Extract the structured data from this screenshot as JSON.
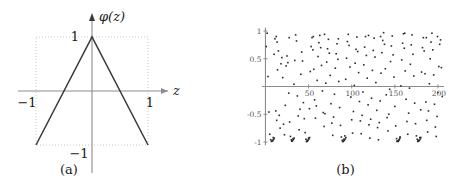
{
  "figure": {
    "panel_a": {
      "caption": "(a)",
      "yaxis_label": "φ(z)",
      "xaxis_label": "z",
      "ticks": {
        "y_top": "1",
        "y_bottom": "−1",
        "x_left": "−1",
        "x_right": "1"
      },
      "colors": {
        "curve": "#3a3a3a",
        "axis": "#8d8d8d",
        "box": "#c9c9c9"
      }
    },
    "panel_b": {
      "caption": "(b)",
      "colors": {
        "dot": "#2b2b2b",
        "axis": "#8d8d8d"
      }
    }
  },
  "chart_data": [
    {
      "type": "line",
      "title": "(a)",
      "xlabel": "z",
      "ylabel": "φ(z)",
      "xlim": [
        -1.32,
        1.42
      ],
      "ylim": [
        -1.45,
        1.32
      ],
      "xticks": [
        -1,
        1
      ],
      "xticklabels": [
        "−1",
        "1"
      ],
      "yticks": [
        -1,
        1
      ],
      "yticklabels": [
        "−1",
        "1"
      ],
      "grid": false,
      "bounding_box": {
        "x": [
          -1,
          1
        ],
        "y": [
          -1,
          1
        ],
        "style": "dotted"
      },
      "series": [
        {
          "name": "φ(z)",
          "x": [
            -1,
            0,
            1
          ],
          "values": [
            -1,
            1,
            -1
          ]
        }
      ]
    },
    {
      "type": "scatter",
      "title": "(b)",
      "xlabel": "",
      "ylabel": "",
      "xlim": [
        -4,
        207
      ],
      "ylim": [
        -1.08,
        1.08
      ],
      "xticks": [
        50,
        100,
        150,
        200
      ],
      "xticklabels": [
        "50",
        "100",
        "150",
        "200"
      ],
      "yticks": [
        -1,
        -0.5,
        0.5,
        1
      ],
      "yticklabels": [
        "-1",
        "-0.5",
        "0.5",
        "1"
      ],
      "grid": false,
      "n_points": 252,
      "points": [
        [
          1,
          0.72
        ],
        [
          2,
          0.96
        ],
        [
          3,
          0.18
        ],
        [
          4,
          -0.46
        ],
        [
          5,
          -0.86
        ],
        [
          6,
          -0.96
        ],
        [
          7,
          -0.99
        ],
        [
          8,
          -0.97
        ],
        [
          9,
          -0.92
        ],
        [
          10,
          0.58
        ],
        [
          11,
          0.86
        ],
        [
          12,
          -0.44
        ],
        [
          13,
          -0.61
        ],
        [
          14,
          0.3
        ],
        [
          15,
          0.64
        ],
        [
          16,
          -0.52
        ],
        [
          17,
          -0.75
        ],
        [
          18,
          0.41
        ],
        [
          19,
          0.52
        ],
        [
          20,
          0.16
        ],
        [
          21,
          -0.68
        ],
        [
          22,
          -0.87
        ],
        [
          23,
          -0.34
        ],
        [
          24,
          0.37
        ],
        [
          25,
          0.55
        ],
        [
          26,
          0.43
        ],
        [
          27,
          -0.12
        ],
        [
          28,
          -0.64
        ],
        [
          29,
          -0.9
        ],
        [
          30,
          -0.96
        ],
        [
          31,
          -0.98
        ],
        [
          32,
          -0.94
        ],
        [
          33,
          0.04
        ],
        [
          34,
          0.47
        ],
        [
          35,
          0.93
        ],
        [
          36,
          0.82
        ],
        [
          37,
          -0.17
        ],
        [
          38,
          -0.53
        ],
        [
          39,
          -0.78
        ],
        [
          40,
          -0.41
        ],
        [
          41,
          0.22
        ],
        [
          42,
          0.62
        ],
        [
          43,
          0.46
        ],
        [
          44,
          -0.29
        ],
        [
          45,
          -0.58
        ],
        [
          46,
          -0.83
        ],
        [
          47,
          -0.95
        ],
        [
          48,
          -0.99
        ],
        [
          49,
          -0.97
        ],
        [
          50,
          -0.93
        ],
        [
          51,
          -0.4
        ],
        [
          52,
          0.27
        ],
        [
          53,
          0.72
        ],
        [
          54,
          0.88
        ],
        [
          55,
          0.66
        ],
        [
          56,
          0.31
        ],
        [
          57,
          -0.24
        ],
        [
          58,
          -0.57
        ],
        [
          59,
          -0.35
        ],
        [
          60,
          0.11
        ],
        [
          61,
          0.54
        ],
        [
          62,
          0.79
        ],
        [
          63,
          0.92
        ],
        [
          64,
          0.7
        ],
        [
          65,
          0.38
        ],
        [
          66,
          -0.08
        ],
        [
          67,
          -0.47
        ],
        [
          68,
          -0.72
        ],
        [
          69,
          -0.49
        ],
        [
          70,
          0.06
        ],
        [
          71,
          0.44
        ],
        [
          72,
          0.68
        ],
        [
          73,
          0.85
        ],
        [
          74,
          0.6
        ],
        [
          75,
          0.2
        ],
        [
          76,
          -0.31
        ],
        [
          77,
          -0.66
        ],
        [
          78,
          -0.88
        ],
        [
          79,
          -0.55
        ],
        [
          80,
          -0.14
        ],
        [
          81,
          0.33
        ],
        [
          82,
          0.59
        ],
        [
          83,
          0.77
        ],
        [
          84,
          0.49
        ],
        [
          85,
          0.09
        ],
        [
          86,
          -0.38
        ],
        [
          87,
          -0.7
        ],
        [
          88,
          -0.91
        ],
        [
          89,
          -0.97
        ],
        [
          90,
          -0.99
        ],
        [
          91,
          -0.95
        ],
        [
          92,
          -0.89
        ],
        [
          93,
          0.13
        ],
        [
          94,
          0.51
        ],
        [
          95,
          0.81
        ],
        [
          96,
          0.94
        ],
        [
          97,
          0.74
        ],
        [
          98,
          0.35
        ],
        [
          99,
          -0.19
        ],
        [
          100,
          -0.6
        ],
        [
          101,
          -0.84
        ],
        [
          102,
          -0.45
        ],
        [
          103,
          0.02
        ],
        [
          104,
          0.42
        ],
        [
          105,
          0.67
        ],
        [
          106,
          0.89
        ],
        [
          107,
          0.63
        ],
        [
          108,
          0.25
        ],
        [
          109,
          -0.27
        ],
        [
          110,
          -0.62
        ],
        [
          111,
          -0.85
        ],
        [
          112,
          -0.52
        ],
        [
          113,
          -0.1
        ],
        [
          114,
          0.39
        ],
        [
          115,
          0.71
        ],
        [
          116,
          0.9
        ],
        [
          117,
          0.56
        ],
        [
          118,
          0.15
        ],
        [
          119,
          -0.33
        ],
        [
          120,
          -0.69
        ],
        [
          121,
          -0.93
        ],
        [
          122,
          -0.59
        ],
        [
          123,
          -0.21
        ],
        [
          124,
          0.29
        ],
        [
          125,
          0.65
        ],
        [
          126,
          0.87
        ],
        [
          127,
          0.53
        ],
        [
          128,
          0.07
        ],
        [
          129,
          -0.43
        ],
        [
          130,
          -0.74
        ],
        [
          131,
          -0.96
        ],
        [
          132,
          -0.65
        ],
        [
          133,
          -0.26
        ],
        [
          134,
          0.24
        ],
        [
          135,
          0.61
        ],
        [
          136,
          0.83
        ],
        [
          137,
          0.97
        ],
        [
          138,
          0.76
        ],
        [
          139,
          0.32
        ],
        [
          140,
          -0.15
        ],
        [
          141,
          -0.56
        ],
        [
          142,
          -0.8
        ],
        [
          143,
          -0.5
        ],
        [
          144,
          -0.05
        ],
        [
          145,
          0.45
        ],
        [
          146,
          0.73
        ],
        [
          147,
          0.91
        ],
        [
          148,
          0.57
        ],
        [
          149,
          0.17
        ],
        [
          150,
          -0.36
        ],
        [
          151,
          -0.71
        ],
        [
          152,
          -0.94
        ],
        [
          153,
          -0.98
        ],
        [
          154,
          -0.99
        ],
        [
          155,
          -0.96
        ],
        [
          156,
          -0.91
        ],
        [
          157,
          0.01
        ],
        [
          158,
          0.48
        ],
        [
          159,
          0.78
        ],
        [
          160,
          0.95
        ],
        [
          161,
          0.69
        ],
        [
          162,
          0.28
        ],
        [
          163,
          -0.23
        ],
        [
          164,
          -0.63
        ],
        [
          165,
          -0.86
        ],
        [
          166,
          -0.48
        ],
        [
          167,
          -0.03
        ],
        [
          168,
          0.4
        ],
        [
          169,
          0.75
        ],
        [
          170,
          0.93
        ],
        [
          171,
          0.58
        ],
        [
          172,
          0.19
        ],
        [
          173,
          -0.3
        ],
        [
          174,
          -0.67
        ],
        [
          175,
          -0.89
        ],
        [
          176,
          -0.95
        ],
        [
          177,
          -0.98
        ],
        [
          178,
          -0.97
        ],
        [
          179,
          -0.92
        ],
        [
          180,
          -0.42
        ],
        [
          181,
          0.26
        ],
        [
          182,
          0.7
        ],
        [
          183,
          0.88
        ],
        [
          184,
          0.64
        ],
        [
          185,
          0.23
        ],
        [
          186,
          -0.28
        ],
        [
          187,
          -0.61
        ],
        [
          188,
          -0.82
        ],
        [
          189,
          -0.44
        ],
        [
          190,
          0.05
        ],
        [
          191,
          0.5
        ],
        [
          192,
          0.8
        ],
        [
          193,
          0.96
        ],
        [
          194,
          0.66
        ],
        [
          195,
          0.21
        ],
        [
          196,
          -0.32
        ],
        [
          197,
          -0.73
        ],
        [
          198,
          -0.9
        ],
        [
          199,
          -0.54
        ],
        [
          200,
          -0.11
        ],
        [
          201,
          0.36
        ],
        [
          202,
          0.76
        ],
        [
          203,
          0.84
        ],
        [
          204,
          0.34
        ],
        [
          205,
          -0.18
        ],
        [
          7.5,
          -0.985
        ],
        [
          8.5,
          -0.975
        ],
        [
          9.5,
          -0.955
        ],
        [
          10.2,
          -0.93
        ],
        [
          30.5,
          -0.985
        ],
        [
          31.5,
          -0.975
        ],
        [
          32.5,
          -0.955
        ],
        [
          33.2,
          -0.93
        ],
        [
          47.5,
          -0.99
        ],
        [
          48.5,
          -0.985
        ],
        [
          49.5,
          -0.97
        ],
        [
          50.5,
          -0.945
        ],
        [
          51.2,
          -0.92
        ],
        [
          89.5,
          -0.99
        ],
        [
          90.5,
          -0.985
        ],
        [
          91.5,
          -0.97
        ],
        [
          92.5,
          -0.945
        ],
        [
          93.2,
          -0.92
        ],
        [
          152.5,
          -0.99
        ],
        [
          153.5,
          -0.985
        ],
        [
          154.5,
          -0.97
        ],
        [
          155.5,
          -0.945
        ],
        [
          156.2,
          -0.92
        ],
        [
          176.5,
          -0.99
        ],
        [
          177.5,
          -0.985
        ],
        [
          178.5,
          -0.97
        ],
        [
          179.5,
          -0.945
        ],
        [
          180.2,
          -0.92
        ],
        [
          12.5,
          0.9
        ],
        [
          13.5,
          0.8
        ],
        [
          27.5,
          0.88
        ],
        [
          55.5,
          0.9
        ],
        [
          68.5,
          0.94
        ],
        [
          84.5,
          0.86
        ],
        [
          119.5,
          0.92
        ],
        [
          133.5,
          0.9
        ],
        [
          161.5,
          0.96
        ],
        [
          186.5,
          0.88
        ],
        [
          199.5,
          0.9
        ]
      ]
    }
  ]
}
